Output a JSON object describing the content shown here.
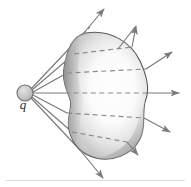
{
  "figure": {
    "name": "gauss-law-point-charge-through-closed-surface",
    "width": 191,
    "height": 187,
    "background_color": "#ffffff"
  },
  "charge": {
    "label": "q",
    "name": "point-charge",
    "cx": 25,
    "cy": 93,
    "r": 8,
    "fill_color": "#bfbfbf",
    "stroke_color": "#6e6e6e"
  },
  "surface": {
    "name": "closed-gaussian-surface",
    "kind": "irregular-closed-blob",
    "outline_color": "#5a5a5a",
    "fill_light": "#fdfdfd",
    "fill_mid": "#c9c9c9",
    "fill_dark": "#8f8f8f",
    "bbox": [
      62,
      32,
      152,
      160
    ]
  },
  "field_lines": {
    "name": "electric-field-lines",
    "color": "#7a7a7a",
    "dashed_color": "#8a8a8a",
    "count": 7,
    "origin": [
      25,
      93
    ],
    "rays": [
      {
        "id": "ray-1",
        "tip": [
          106,
          7
        ],
        "label": "upper-outer-ray"
      },
      {
        "id": "ray-2",
        "tip": [
          138,
          24
        ],
        "label": "upper-ray"
      },
      {
        "id": "ray-3",
        "tip": [
          174,
          50
        ],
        "label": "upper-inner-ray"
      },
      {
        "id": "ray-4",
        "tip": [
          181,
          93
        ],
        "label": "horizontal-ray"
      },
      {
        "id": "ray-5",
        "tip": [
          172,
          133
        ],
        "label": "lower-inner-ray"
      },
      {
        "id": "ray-6",
        "tip": [
          140,
          156
        ],
        "label": "lower-ray"
      },
      {
        "id": "ray-7",
        "tip": [
          105,
          180
        ],
        "label": "lower-outer-ray"
      }
    ]
  },
  "baseline": {
    "name": "bottom-rule",
    "color": "#d8d8d8",
    "y": 180
  }
}
